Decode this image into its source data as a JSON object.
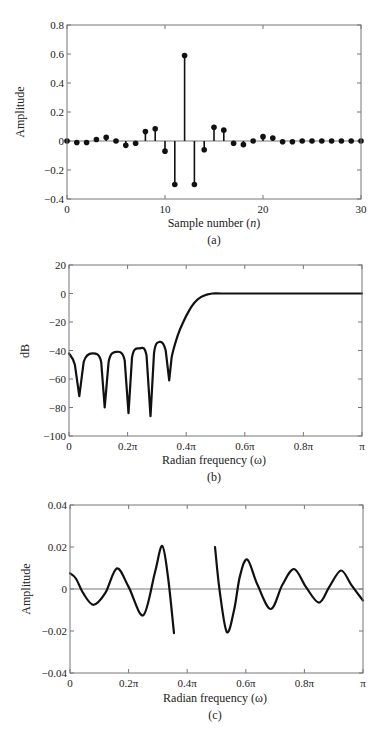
{
  "chart_data": [
    {
      "type": "stem",
      "panel": "a",
      "caption": "(a)",
      "xlabel": "Sample number (n)",
      "xlabel_parts": [
        "Sample number (",
        "n",
        ")"
      ],
      "ylabel": "Amplitude",
      "xlim": [
        0,
        30
      ],
      "ylim": [
        -0.4,
        0.8
      ],
      "xticks": [
        0,
        10,
        20,
        30
      ],
      "xtick_labels": [
        "0",
        "10",
        "20",
        "30"
      ],
      "yticks": [
        -0.4,
        -0.2,
        0,
        0.2,
        0.4,
        0.6,
        0.8
      ],
      "ytick_labels": [
        "−0.4",
        "−0.2",
        "0",
        "0.2",
        "0.4",
        "0.6",
        "0.8"
      ],
      "grid": false,
      "x": [
        0,
        1,
        2,
        3,
        4,
        5,
        6,
        7,
        8,
        9,
        10,
        11,
        12,
        13,
        14,
        15,
        16,
        17,
        18,
        19,
        20,
        21,
        22,
        23,
        24,
        25,
        26,
        27,
        28,
        29,
        30
      ],
      "values": [
        0,
        -0.01,
        -0.01,
        0.01,
        0.025,
        0,
        -0.03,
        -0.015,
        0.065,
        0.085,
        -0.07,
        -0.3,
        0.59,
        -0.3,
        -0.06,
        0.095,
        0.075,
        -0.015,
        -0.025,
        0,
        0.03,
        0.02,
        -0.005,
        -0.005,
        0,
        0,
        0,
        0,
        0,
        0,
        0
      ]
    },
    {
      "type": "line",
      "panel": "b",
      "caption": "(b)",
      "xlabel": "Radian frequency (ω)",
      "ylabel": "dB",
      "xlim": [
        0,
        1
      ],
      "xunit": "pi",
      "ylim": [
        -100,
        20
      ],
      "xticks": [
        0,
        0.2,
        0.4,
        0.6,
        0.8,
        1.0
      ],
      "xtick_labels": [
        "0",
        "0.2π",
        "0.4π",
        "0.6π",
        "0.8π",
        "π"
      ],
      "yticks": [
        -100,
        -80,
        -60,
        -40,
        -20,
        0,
        20
      ],
      "ytick_labels": [
        "−100",
        "−80",
        "−60",
        "−40",
        "−20",
        "0",
        "20"
      ],
      "grid": false,
      "series": [
        {
          "name": "magnitude response",
          "x": [
            0,
            0.02,
            0.035,
            0.05,
            0.08,
            0.11,
            0.122,
            0.135,
            0.16,
            0.19,
            0.203,
            0.215,
            0.24,
            0.265,
            0.278,
            0.29,
            0.31,
            0.33,
            0.342,
            0.35,
            0.37,
            0.39,
            0.41,
            0.43,
            0.45,
            0.47,
            0.49,
            0.52,
            0.6,
            0.8,
            1.0
          ],
          "values": [
            -42,
            -50,
            -72,
            -48,
            -42,
            -48,
            -80,
            -48,
            -41,
            -47,
            -84,
            -45,
            -38.5,
            -44,
            -86,
            -42,
            -34,
            -40,
            -61,
            -45,
            -30,
            -20,
            -12,
            -6,
            -2.5,
            -0.8,
            0,
            0,
            0,
            0,
            0
          ]
        }
      ],
      "annotations": {
        "stopband_nulls_pi": [
          0.035,
          0.122,
          0.203,
          0.278,
          0.342
        ],
        "stopband_peaks_db": [
          -42,
          -41,
          -38.5,
          -34
        ],
        "passband_level_db": 0
      }
    },
    {
      "type": "line",
      "panel": "c",
      "caption": "(c)",
      "xlabel": "Radian frequency (ω)",
      "ylabel": "Amplitude",
      "xlim": [
        0,
        1
      ],
      "xunit": "pi",
      "ylim": [
        -0.04,
        0.04
      ],
      "xticks": [
        0,
        0.2,
        0.4,
        0.6,
        0.8,
        1.0
      ],
      "xtick_labels": [
        "0",
        "0.2π",
        "0.4π",
        "0.6π",
        "0.8π",
        "π"
      ],
      "yticks": [
        -0.04,
        -0.02,
        0,
        0.02,
        0.04
      ],
      "ytick_labels": [
        "−0.04",
        "−0.02",
        "0",
        "0.02",
        "0.04"
      ],
      "grid": false,
      "series": [
        {
          "name": "error segment 1 (stopband)",
          "x": [
            0,
            0.02,
            0.045,
            0.08,
            0.12,
            0.16,
            0.2,
            0.25,
            0.29,
            0.315,
            0.335,
            0.355
          ],
          "values": [
            0.0075,
            0.005,
            -0.002,
            -0.0075,
            -0.002,
            0.0098,
            0.001,
            -0.0125,
            0.008,
            0.0205,
            0.005,
            -0.021
          ]
        },
        {
          "name": "error segment 2 (passband)",
          "x": [
            0.495,
            0.51,
            0.535,
            0.56,
            0.58,
            0.605,
            0.64,
            0.685,
            0.725,
            0.765,
            0.805,
            0.85,
            0.885,
            0.925,
            0.96,
            1.0
          ],
          "values": [
            0.02,
            0.0,
            -0.0205,
            -0.01,
            0.006,
            0.014,
            0.002,
            -0.0095,
            0.002,
            0.0095,
            0.001,
            -0.0065,
            0.001,
            0.0088,
            0.002,
            -0.0055
          ]
        }
      ]
    }
  ]
}
